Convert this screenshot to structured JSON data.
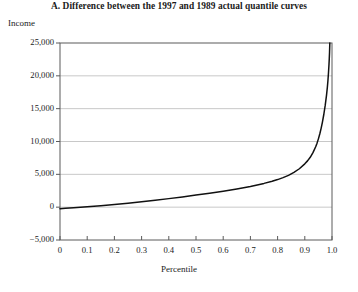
{
  "chart_data": {
    "type": "line",
    "title": "A. Difference between the 1997 and 1989 actual quantile curves",
    "xlabel": "Percentile",
    "ylabel": "Income",
    "xlim": [
      0,
      1.0
    ],
    "ylim": [
      -5000,
      25000
    ],
    "grid": true,
    "grid_axis": "y",
    "legend": "none",
    "line_color": "#111111",
    "grid_color": "#c8c8c8",
    "axis_color": "#5a5a5a",
    "background_color": "#ffffff",
    "xticks": [
      0,
      0.1,
      0.2,
      0.3,
      0.4,
      0.5,
      0.6,
      0.7,
      0.8,
      0.9,
      1.0
    ],
    "xtick_labels": [
      "0",
      "0.1",
      "0.2",
      "0.3",
      "0.4",
      "0.5",
      "0.6",
      "0.7",
      "0.8",
      "0.9",
      "1.0"
    ],
    "yticks": [
      -5000,
      0,
      5000,
      10000,
      15000,
      20000,
      25000
    ],
    "ytick_labels": [
      "−5,000",
      "0",
      "5,000",
      "10,000",
      "15,000",
      "20,000",
      "25,000"
    ],
    "series": [
      {
        "name": "Difference between 1997 and 1989 actual quantile curves",
        "x": [
          0.0,
          0.02,
          0.05,
          0.1,
          0.15,
          0.2,
          0.25,
          0.3,
          0.35,
          0.4,
          0.45,
          0.5,
          0.55,
          0.6,
          0.65,
          0.7,
          0.75,
          0.78,
          0.8,
          0.82,
          0.84,
          0.86,
          0.88,
          0.9,
          0.91,
          0.92,
          0.93,
          0.94,
          0.945,
          0.95,
          0.955,
          0.96,
          0.965,
          0.97,
          0.975,
          0.98,
          0.983,
          0.985,
          0.987,
          0.989,
          0.99,
          0.991,
          0.992
        ],
        "y": [
          -250,
          -180,
          -90,
          60,
          220,
          400,
          600,
          820,
          1050,
          1300,
          1560,
          1840,
          2130,
          2440,
          2780,
          3160,
          3620,
          3950,
          4200,
          4500,
          4850,
          5300,
          5850,
          6600,
          7050,
          7600,
          8300,
          9200,
          9750,
          10400,
          11150,
          12000,
          13000,
          14150,
          15500,
          17100,
          18300,
          19250,
          20400,
          21800,
          22600,
          23600,
          25000
        ]
      }
    ]
  },
  "axes_geometry": {
    "left": 60,
    "right": 332,
    "top": 43,
    "bottom": 240
  }
}
